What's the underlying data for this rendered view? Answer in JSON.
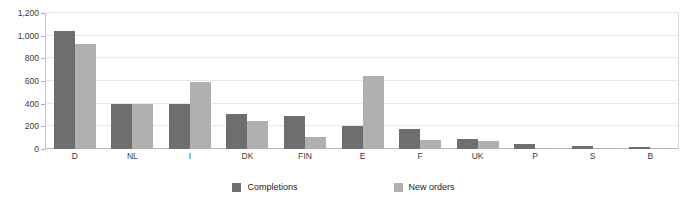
{
  "chart_data": {
    "type": "bar",
    "title": "",
    "subtitle": "",
    "xlabel": "",
    "ylabel": "",
    "categories": [
      "D",
      "NL",
      "I",
      "DK",
      "FIN",
      "E",
      "F",
      "UK",
      "P",
      "S",
      "B"
    ],
    "series": [
      {
        "name": "Completions",
        "color": "#6e6e6e",
        "values": [
          1045,
          400,
          395,
          310,
          290,
          205,
          175,
          85,
          45,
          28,
          18
        ]
      },
      {
        "name": "New orders",
        "color": "#b0b0b0",
        "values": [
          925,
          400,
          595,
          250,
          110,
          640,
          80,
          75,
          8,
          10,
          5
        ]
      }
    ],
    "ylim": [
      0,
      1200
    ],
    "yticks": [
      0,
      200,
      400,
      600,
      800,
      1000,
      1200
    ],
    "ytick_labels": [
      "0",
      "200",
      "400",
      "600",
      "800",
      "1,000",
      "1,200"
    ],
    "grid": true,
    "legend_position": "bottom",
    "annotations": []
  },
  "legend": {
    "items": [
      {
        "label": "Completions",
        "color": "#6e6e6e"
      },
      {
        "label": "New orders",
        "color": "#b0b0b0"
      }
    ]
  },
  "colors": {
    "completions": "#6e6e6e",
    "new_orders": "#b0b0b0",
    "gridline": "#e8e8e8",
    "axis": "#b8b8b8",
    "text": "#3a3a3a",
    "background": "#ffffff"
  }
}
